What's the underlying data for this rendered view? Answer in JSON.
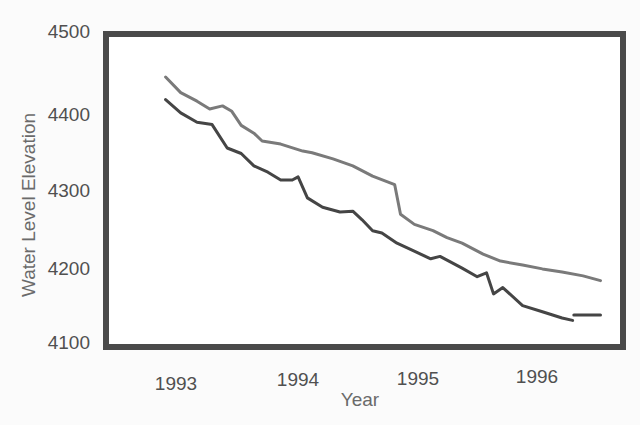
{
  "chart_data": {
    "type": "line",
    "title": "",
    "xlabel": "Year",
    "ylabel": "Water Level Elevation",
    "xlim": [
      1992.7,
      1997.6
    ],
    "ylim": [
      4100,
      4500
    ],
    "x_ticks": [
      1993,
      1994,
      1995,
      1996
    ],
    "y_ticks": [
      4100,
      4200,
      4300,
      4400,
      4500
    ],
    "grid": false,
    "legend": "none",
    "series": [
      {
        "name": "upper-series",
        "color": "#7a7a7a",
        "points": [
          [
            1992.85,
            4441
          ],
          [
            1992.98,
            4421
          ],
          [
            1993.12,
            4410
          ],
          [
            1993.23,
            4400
          ],
          [
            1993.34,
            4404
          ],
          [
            1993.42,
            4397
          ],
          [
            1993.5,
            4379
          ],
          [
            1993.61,
            4369
          ],
          [
            1993.68,
            4359
          ],
          [
            1993.84,
            4355
          ],
          [
            1994.03,
            4346
          ],
          [
            1994.11,
            4344
          ],
          [
            1994.29,
            4336
          ],
          [
            1994.46,
            4327
          ],
          [
            1994.63,
            4314
          ],
          [
            1994.82,
            4303
          ],
          [
            1994.87,
            4265
          ],
          [
            1994.99,
            4252
          ],
          [
            1995.15,
            4244
          ],
          [
            1995.27,
            4235
          ],
          [
            1995.4,
            4228
          ],
          [
            1995.58,
            4214
          ],
          [
            1995.73,
            4205
          ],
          [
            1995.92,
            4200
          ],
          [
            1996.09,
            4195
          ],
          [
            1996.26,
            4191
          ],
          [
            1996.44,
            4186
          ],
          [
            1996.59,
            4180
          ]
        ]
      },
      {
        "name": "lower-series",
        "color": "#454545",
        "points": [
          [
            1992.85,
            4412
          ],
          [
            1992.98,
            4395
          ],
          [
            1993.12,
            4383
          ],
          [
            1993.25,
            4380
          ],
          [
            1993.38,
            4350
          ],
          [
            1993.5,
            4343
          ],
          [
            1993.61,
            4327
          ],
          [
            1993.73,
            4319
          ],
          [
            1993.84,
            4309
          ],
          [
            1993.94,
            4309
          ],
          [
            1993.99,
            4313
          ],
          [
            1994.07,
            4286
          ],
          [
            1994.2,
            4274
          ],
          [
            1994.35,
            4268
          ],
          [
            1994.46,
            4269
          ],
          [
            1994.54,
            4258
          ],
          [
            1994.63,
            4244
          ],
          [
            1994.71,
            4241
          ],
          [
            1994.84,
            4228
          ],
          [
            1994.97,
            4219
          ],
          [
            1995.13,
            4208
          ],
          [
            1995.21,
            4211
          ],
          [
            1995.4,
            4196
          ],
          [
            1995.53,
            4185
          ],
          [
            1995.61,
            4190
          ],
          [
            1995.67,
            4163
          ],
          [
            1995.75,
            4171
          ],
          [
            1995.92,
            4148
          ],
          [
            1996.09,
            4140
          ],
          [
            1996.26,
            4132
          ],
          [
            1996.35,
            4129
          ]
        ]
      },
      {
        "name": "lower-series-continuation",
        "color": "#454545",
        "points": [
          [
            1996.36,
            4136
          ],
          [
            1996.59,
            4136
          ]
        ]
      }
    ]
  },
  "axes": {
    "x_title": "Year",
    "y_title": "Water Level Elevation",
    "x_tick_labels": [
      "1993",
      "1994",
      "1995",
      "1996"
    ],
    "y_tick_labels": [
      "4500",
      "4400",
      "4300",
      "4200",
      "4100"
    ]
  },
  "colors": {
    "frame": "#4a4a4a",
    "background": "#fbfbfb",
    "upper_line": "#7a7a7a",
    "lower_line": "#454545"
  }
}
